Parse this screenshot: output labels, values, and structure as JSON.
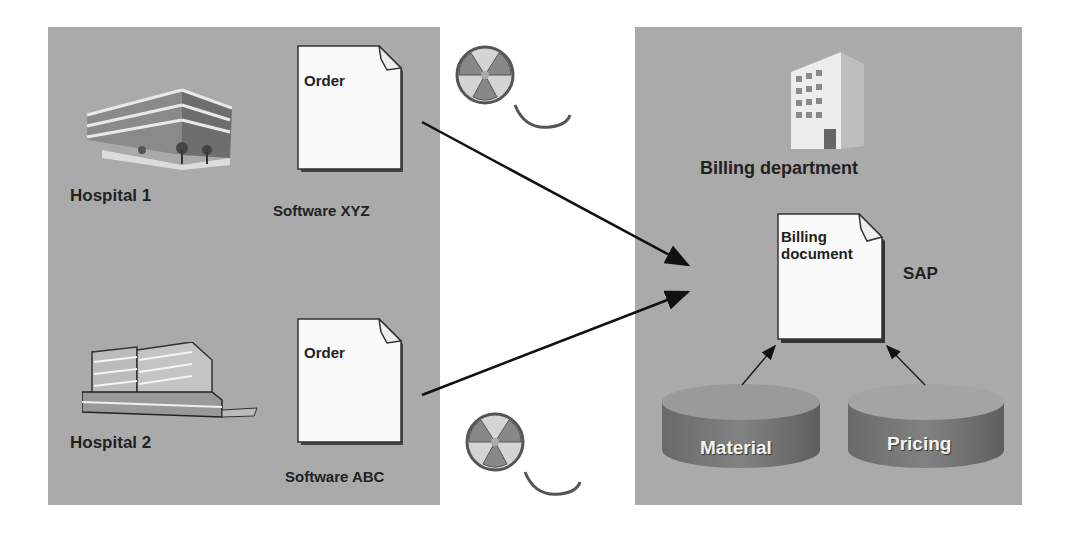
{
  "diagram": {
    "type": "process-flow",
    "left_panel": {
      "hospitals": [
        {
          "label": "Hospital 1",
          "icon": "office-building-icon"
        },
        {
          "label": "Hospital 2",
          "icon": "low-rise-building-icon"
        }
      ],
      "documents": [
        {
          "title": "Order",
          "caption": "Software XYZ"
        },
        {
          "title": "Order",
          "caption": "Software ABC"
        }
      ]
    },
    "transfer_media": [
      {
        "icon": "radioactive-film-reel-icon"
      },
      {
        "icon": "radioactive-film-reel-icon"
      }
    ],
    "right_panel": {
      "department": {
        "label": "Billing department",
        "icon": "tower-building-icon"
      },
      "billing_document": {
        "title_line1": "Billing",
        "title_line2": "document",
        "system_label": "SAP"
      },
      "data_sources": [
        {
          "label": "Material"
        },
        {
          "label": "Pricing"
        }
      ]
    },
    "edges": [
      {
        "from": "Order (Software XYZ)",
        "to": "Billing document"
      },
      {
        "from": "Order (Software ABC)",
        "to": "Billing document"
      },
      {
        "from": "Material",
        "to": "Billing document"
      },
      {
        "from": "Pricing",
        "to": "Billing document"
      }
    ],
    "colors": {
      "panel": "#aaaaaa",
      "document": "#ffffff",
      "cylinder": "#7a7a7a",
      "text": "#222222"
    }
  }
}
